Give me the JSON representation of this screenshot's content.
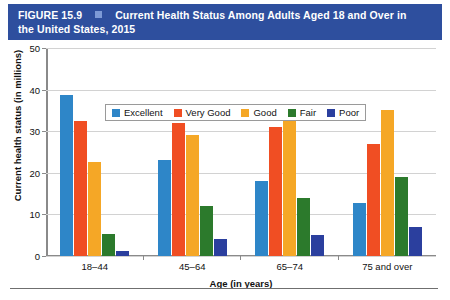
{
  "header": {
    "figure_number": "FIGURE 15.9",
    "separator_icon": "square-bullet-icon",
    "title_line1": "Current Health Status Among Adults Aged 18 and Over in",
    "title_line2": "the United States, 2015",
    "bar_color": "#2e4f9e",
    "square_color": "#7d9ad6"
  },
  "legend": {
    "position": "top-center-inside",
    "items": [
      {
        "label": "Excellent",
        "color": "#2e86c8"
      },
      {
        "label": "Very Good",
        "color": "#f04e23"
      },
      {
        "label": "Good",
        "color": "#f5a726"
      },
      {
        "label": "Fair",
        "color": "#2c7a2c"
      },
      {
        "label": "Poor",
        "color": "#2b3f9e"
      }
    ]
  },
  "chart_data": {
    "type": "bar",
    "title": "Current Health Status Among Adults Aged 18 and Over in the United States, 2015",
    "xlabel": "Age (in years)",
    "ylabel": "Current health status (in millions)",
    "categories": [
      "18–44",
      "45–64",
      "65–74",
      "75 and over"
    ],
    "series": [
      {
        "name": "Excellent",
        "color": "#2e86c8",
        "values": [
          38.7,
          23.0,
          18.0,
          12.8
        ]
      },
      {
        "name": "Very Good",
        "color": "#f04e23",
        "values": [
          32.5,
          32.0,
          31.0,
          27.0
        ]
      },
      {
        "name": "Good",
        "color": "#f5a726",
        "values": [
          22.5,
          29.0,
          32.5,
          35.0
        ]
      },
      {
        "name": "Fair",
        "color": "#2c7a2c",
        "values": [
          5.2,
          12.0,
          14.0,
          19.0
        ]
      },
      {
        "name": "Poor",
        "color": "#2b3f9e",
        "values": [
          1.2,
          4.2,
          5.0,
          7.0
        ]
      }
    ],
    "ylim": [
      0,
      50
    ],
    "yticks": [
      0,
      10,
      20,
      30,
      40,
      50
    ],
    "ytick_labels": [
      "0",
      "10",
      "20",
      "30",
      "40",
      "50"
    ],
    "grid": true,
    "legend_position": "upper center"
  }
}
